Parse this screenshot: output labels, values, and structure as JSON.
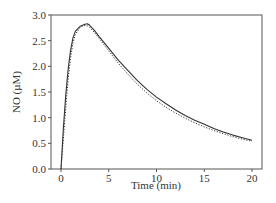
{
  "chart_data": {
    "type": "line",
    "title": "",
    "xlabel": "Time (min)",
    "ylabel": "NO (µM)",
    "xlim": [
      -1,
      20.5
    ],
    "ylim": [
      0,
      3.0
    ],
    "xticks": [
      0,
      5,
      10,
      15,
      20
    ],
    "yticks": [
      0.0,
      0.5,
      1.0,
      1.5,
      2.0,
      2.5,
      3.0
    ],
    "xtick_labels": [
      "0",
      "5",
      "10",
      "15",
      "20"
    ],
    "ytick_labels": [
      "0.0",
      "0.5",
      "1.0",
      "1.5",
      "2.0",
      "2.5",
      "3.0"
    ],
    "grid": false,
    "legend": null,
    "series": [
      {
        "name": "measured",
        "style": "solid",
        "x": [
          0,
          0.25,
          0.5,
          0.75,
          1.0,
          1.25,
          1.5,
          2.0,
          2.5,
          2.75,
          3.0,
          3.5,
          4.0,
          5.0,
          6.0,
          7.0,
          8.0,
          9.0,
          10.0,
          11.0,
          12.0,
          13.0,
          14.0,
          15.0,
          16.0,
          17.0,
          18.0,
          19.0,
          20.0
        ],
        "y": [
          0.0,
          0.8,
          1.45,
          1.95,
          2.3,
          2.55,
          2.68,
          2.78,
          2.82,
          2.83,
          2.8,
          2.7,
          2.58,
          2.35,
          2.12,
          1.92,
          1.72,
          1.55,
          1.4,
          1.27,
          1.15,
          1.04,
          0.95,
          0.87,
          0.79,
          0.72,
          0.66,
          0.61,
          0.56
        ]
      },
      {
        "name": "model",
        "style": "dotted",
        "x": [
          0,
          0.25,
          0.5,
          0.75,
          1.0,
          1.25,
          1.5,
          2.0,
          2.5,
          2.75,
          3.0,
          3.5,
          4.0,
          5.0,
          6.0,
          7.0,
          8.0,
          9.0,
          10.0,
          11.0,
          12.0,
          13.0,
          14.0,
          15.0,
          16.0,
          17.0,
          18.0,
          19.0,
          20.0
        ],
        "y": [
          0.0,
          0.6,
          1.2,
          1.75,
          2.15,
          2.45,
          2.62,
          2.76,
          2.8,
          2.79,
          2.76,
          2.66,
          2.54,
          2.3,
          2.06,
          1.85,
          1.65,
          1.48,
          1.33,
          1.2,
          1.09,
          0.99,
          0.9,
          0.82,
          0.75,
          0.69,
          0.63,
          0.58,
          0.54
        ]
      }
    ]
  },
  "axes": {
    "x_title": "Time (min)",
    "y_title": "NO (µM)"
  }
}
